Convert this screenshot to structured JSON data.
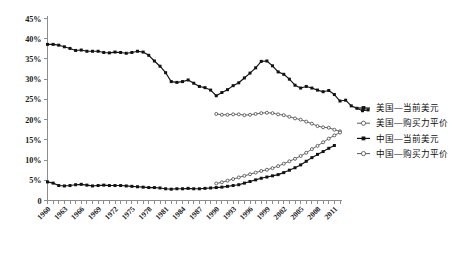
{
  "chart_data": {
    "type": "line",
    "title": "",
    "xlabel": "",
    "ylabel": "",
    "ylim": [
      0,
      45
    ],
    "ytick_labels": [
      "0",
      "5%",
      "10%",
      "15%",
      "20%",
      "25%",
      "30%",
      "35%",
      "40%",
      "45%"
    ],
    "ytick_values": [
      0,
      5,
      10,
      15,
      20,
      25,
      30,
      35,
      40,
      45
    ],
    "xtick_labels": [
      "1960",
      "1963",
      "1966",
      "1969",
      "1972",
      "1975",
      "1978",
      "1981",
      "1984",
      "1987",
      "1990",
      "1993",
      "1996",
      "1999",
      "2002",
      "2005",
      "2008",
      "2011"
    ],
    "x_start": 1960,
    "x_end": 2012,
    "grid": false,
    "legend_position": "right",
    "unit": "%",
    "series": [
      {
        "name": "美国—当前美元",
        "marker": "filled-square",
        "color": "#121212",
        "x_start": 1960,
        "values": [
          38.6,
          38.6,
          38.4,
          38.0,
          37.6,
          37.1,
          37.2,
          36.9,
          36.9,
          36.9,
          36.6,
          36.5,
          36.7,
          36.6,
          36.4,
          36.6,
          36.9,
          36.7,
          35.9,
          34.5,
          33.2,
          31.6,
          29.4,
          29.2,
          29.4,
          29.8,
          29.0,
          28.2,
          27.9,
          27.3,
          25.9,
          26.7,
          27.4,
          28.4,
          29.1,
          30.3,
          31.5,
          32.8,
          34.4,
          34.5,
          33.3,
          31.8,
          31.2,
          30.0,
          28.5,
          27.8,
          28.2,
          27.8,
          27.3,
          26.9,
          27.2,
          26.2,
          24.6,
          24.8,
          23.4,
          22.8,
          22.2,
          22.4
        ]
      },
      {
        "name": "美国—购买力平价",
        "marker": "hollow-circle",
        "color": "#3c3c3c",
        "x_start": 1990,
        "values": [
          21.4,
          21.2,
          21.2,
          21.3,
          21.3,
          21.1,
          21.2,
          21.4,
          21.6,
          21.7,
          21.6,
          21.3,
          21.1,
          20.7,
          20.3,
          20.0,
          19.5,
          19.0,
          18.4,
          18.1,
          18.0,
          17.5,
          17.1
        ]
      },
      {
        "name": "中国—当前美元",
        "marker": "filled-square",
        "color": "#121212",
        "x_start": 1960,
        "values": [
          4.6,
          4.3,
          3.7,
          3.6,
          3.7,
          3.9,
          4.0,
          3.8,
          3.6,
          3.7,
          3.8,
          3.7,
          3.7,
          3.7,
          3.6,
          3.5,
          3.4,
          3.3,
          3.2,
          3.2,
          3.1,
          2.9,
          2.8,
          2.9,
          2.9,
          3.0,
          2.9,
          2.9,
          3.0,
          3.1,
          3.2,
          3.3,
          3.5,
          3.7,
          3.9,
          4.3,
          4.7,
          5.1,
          5.5,
          5.8,
          6.1,
          6.4,
          6.9,
          7.5,
          8.1,
          8.8,
          9.7,
          10.6,
          11.4,
          12.1,
          12.9,
          13.6
        ]
      },
      {
        "name": "中国—购买力平价",
        "marker": "hollow-circle",
        "color": "#3c3c3c",
        "x_start": 1990,
        "values": [
          4.2,
          4.5,
          4.9,
          5.3,
          5.7,
          6.1,
          6.5,
          6.9,
          7.3,
          7.6,
          8.0,
          8.5,
          9.1,
          9.7,
          10.3,
          11.0,
          11.8,
          12.7,
          13.5,
          14.4,
          15.3,
          16.1,
          16.8
        ]
      }
    ]
  },
  "legend": {
    "entries": [
      {
        "label": "美国—当前美元",
        "marker": "filled-square"
      },
      {
        "label": "美国—购买力平价",
        "marker": "hollow-circle"
      },
      {
        "label": "中国—当前美元",
        "marker": "filled-square"
      },
      {
        "label": "中国—购买力平价",
        "marker": "hollow-circle"
      }
    ]
  }
}
